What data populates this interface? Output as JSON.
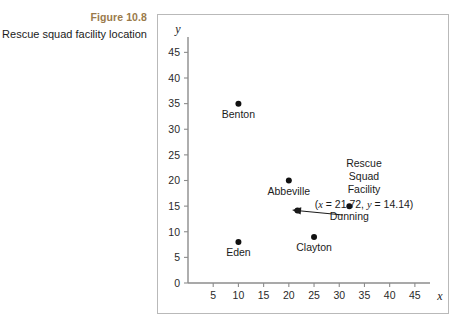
{
  "caption": {
    "figure_number": "Figure 10.8",
    "figure_title": "Rescue squad facility location",
    "accent_color": "#9a7a4a"
  },
  "chart_data": {
    "type": "scatter",
    "title": "",
    "xlabel": "x",
    "ylabel": "y",
    "xlim": [
      0,
      48
    ],
    "ylim": [
      0,
      48
    ],
    "xticks": [
      5,
      10,
      15,
      20,
      25,
      30,
      35,
      40,
      45
    ],
    "yticks": [
      0,
      5,
      10,
      15,
      20,
      25,
      30,
      35,
      40,
      45
    ],
    "grid": false,
    "legend": "none",
    "points": [
      {
        "label": "Benton",
        "x": 10,
        "y": 35,
        "label_pos": "below"
      },
      {
        "label": "Abbeville",
        "x": 20,
        "y": 20,
        "label_pos": "below"
      },
      {
        "label": "Eden",
        "x": 10,
        "y": 8,
        "label_pos": "below"
      },
      {
        "label": "Clayton",
        "x": 25,
        "y": 9,
        "label_pos": "below"
      },
      {
        "label": "Dunning",
        "x": 32,
        "y": 15,
        "label_pos": "below"
      },
      {
        "label": "",
        "x": 21.72,
        "y": 14.14,
        "label_pos": "none"
      }
    ],
    "annotation": {
      "lines": [
        "Rescue",
        "Squad",
        "Facility"
      ],
      "coord_text": "(x = 21.72, y = 14.14)",
      "coord_x_var": "x",
      "coord_x_val": "= 21.72,",
      "coord_y_var": "y",
      "coord_y_val": "= 14.14)",
      "target_x": 21.72,
      "target_y": 14.14
    }
  }
}
